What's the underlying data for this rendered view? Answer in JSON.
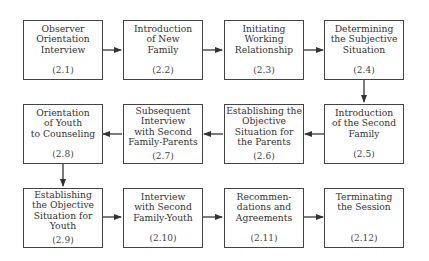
{
  "diagram": {
    "steps": [
      {
        "id": "2.1",
        "label": "Observer\nOrientation\nInterview",
        "number": "(2.1)"
      },
      {
        "id": "2.2",
        "label": "Introduction\nof New\nFamily",
        "number": "(2.2)"
      },
      {
        "id": "2.3",
        "label": "Initiating\nWorking\nRelationship",
        "number": "(2.3)"
      },
      {
        "id": "2.4",
        "label": "Determining\nthe Subjective\nSituation",
        "number": "(2.4)"
      },
      {
        "id": "2.5",
        "label": "Introduction\nof the Second\nFamily",
        "number": "(2.5)"
      },
      {
        "id": "2.6",
        "label": "Establishing the\nObjective\nSituation for\nthe Parents",
        "number": "(2.6)"
      },
      {
        "id": "2.7",
        "label": "Subsequent\nInterview\nwith Second\nFamily-Parents",
        "number": "(2.7)"
      },
      {
        "id": "2.8",
        "label": "Orientation\nof Youth\nto Counseling",
        "number": "(2.8)"
      },
      {
        "id": "2.9",
        "label": "Establishing\nthe Objective\nSituation for\nYouth",
        "number": "(2.9)"
      },
      {
        "id": "2.10",
        "label": "Interview\nwith Second\nFamily-Youth",
        "number": "(2.10)"
      },
      {
        "id": "2.11",
        "label": "Recommen-\ndations and\nAgreements",
        "number": "(2.11)"
      },
      {
        "id": "2.12",
        "label": "Terminating\nthe Session",
        "number": "(2.12)"
      }
    ],
    "flow": [
      "2.1",
      "2.2",
      "2.3",
      "2.4",
      "2.5",
      "2.6",
      "2.7",
      "2.8",
      "2.9",
      "2.10",
      "2.11",
      "2.12"
    ],
    "colors": {
      "stroke": "#444444",
      "text": "#333333",
      "background": "#ffffff"
    }
  }
}
